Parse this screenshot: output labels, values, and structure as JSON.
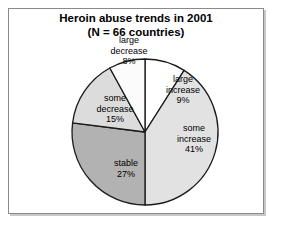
{
  "figure": {
    "title_line1": "Heroin abuse trends in 2001",
    "title_line2": "(N = 66 countries)"
  },
  "chart_data": {
    "type": "pie",
    "title": "Heroin abuse trends in 2001 (N = 66 countries)",
    "subtitle": "(N = 66 countries)",
    "xlabel": "",
    "ylabel": "",
    "legend_position": "none",
    "grid": false,
    "total_countries": 66,
    "categories": [
      "large increase",
      "some increase",
      "stable",
      "some decrease",
      "large decrease"
    ],
    "values": [
      9,
      41,
      27,
      15,
      8
    ],
    "value_unit": "percent",
    "start_angle_deg": 0,
    "direction": "clockwise",
    "slices": [
      {
        "label": "large increase",
        "label_line1": "large",
        "label_line2": "increase",
        "value": 9,
        "value_text": "9%",
        "color": "#ffffff"
      },
      {
        "label": "some increase",
        "label_line1": "some",
        "label_line2": "increase",
        "value": 41,
        "value_text": "41%",
        "color": "#e2e2e2"
      },
      {
        "label": "stable",
        "label_line1": "stable",
        "label_line2": "",
        "value": 27,
        "value_text": "27%",
        "color": "#b2b2b2"
      },
      {
        "label": "some decrease",
        "label_line1": "some",
        "label_line2": "decrease",
        "value": 15,
        "value_text": "15%",
        "color": "#dcdcdc"
      },
      {
        "label": "large decrease",
        "label_line1": "large",
        "label_line2": "decrease",
        "value": 8,
        "value_text": "8%",
        "color": "#fbfbfb"
      }
    ],
    "outline_color": "#1a1a1a",
    "frame_border_color": "#8a8a8a"
  }
}
